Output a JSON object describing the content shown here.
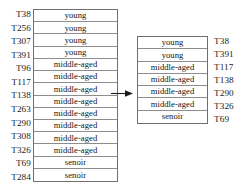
{
  "diagram": {
    "kind": "data-reduction-arrow-diagram",
    "arrow": {
      "icon": "arrow-right-icon",
      "direction": "right",
      "color": "#1b1b1b"
    },
    "colors": {
      "border": "#6f6f6f",
      "rule": "#8d8d8d",
      "text": "#141414",
      "background": "#ffffff"
    }
  },
  "left_table": {
    "column_header": "",
    "row_ids": [
      "T38",
      "T256",
      "T307",
      "T391",
      "T96",
      "T117",
      "T138",
      "T263",
      "T290",
      "T308",
      "T326",
      "T69",
      "T284"
    ],
    "cells": [
      "young",
      "young",
      "young",
      "young",
      "middle-aged",
      "middle-aged",
      "middle-aged",
      "middle-aged",
      "middle-aged",
      "middle-aged",
      "middle-aged",
      "middle-aged",
      "senoir",
      "senoir"
    ],
    "row_count": 14,
    "group_counts": {
      "young": 4,
      "middle-aged": 8,
      "senoir": 2
    }
  },
  "right_table": {
    "column_header": "",
    "row_ids": [
      "T38",
      "T391",
      "T117",
      "T138",
      "T290",
      "T326",
      "T69"
    ],
    "cells": [
      "young",
      "young",
      "middle-aged",
      "middle-aged",
      "middle-aged",
      "middle-aged",
      "senoir"
    ],
    "row_count": 7,
    "group_counts": {
      "young": 2,
      "middle-aged": 4,
      "senoir": 1
    }
  }
}
